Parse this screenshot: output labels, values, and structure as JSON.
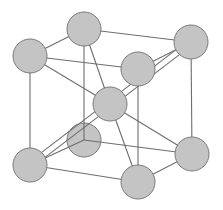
{
  "diagram": {
    "type": "crystal-lattice",
    "structure": "body-centered-cubic",
    "colors": {
      "background": "#ffffff",
      "atom_fill": "#c4c4c4",
      "atom_stroke": "#7a7a7a",
      "bond": "#6e6e6e"
    },
    "atom_radius": 17,
    "atoms": [
      {
        "id": "back-top-left",
        "x": 84,
        "y": 29,
        "layer": "back"
      },
      {
        "id": "back-top-right",
        "x": 191,
        "y": 42,
        "layer": "back"
      },
      {
        "id": "back-bottom-left",
        "x": 84,
        "y": 140,
        "layer": "back"
      },
      {
        "id": "back-bottom-right",
        "x": 192,
        "y": 154,
        "layer": "back"
      },
      {
        "id": "center",
        "x": 110,
        "y": 104,
        "layer": "middle"
      },
      {
        "id": "front-top-left",
        "x": 30,
        "y": 56,
        "layer": "front"
      },
      {
        "id": "front-top-right",
        "x": 138,
        "y": 69,
        "layer": "front"
      },
      {
        "id": "front-bottom-left",
        "x": 30,
        "y": 165,
        "layer": "front"
      },
      {
        "id": "front-bottom-right",
        "x": 138,
        "y": 182,
        "layer": "front"
      }
    ],
    "bonds": [
      {
        "from": "back-top-left",
        "to": "back-top-right"
      },
      {
        "from": "back-top-left",
        "to": "front-top-left"
      },
      {
        "from": "back-top-left",
        "to": "back-bottom-left"
      },
      {
        "from": "back-top-right",
        "to": "front-top-right"
      },
      {
        "from": "back-top-right",
        "to": "back-bottom-right"
      },
      {
        "from": "front-top-left",
        "to": "front-top-right"
      },
      {
        "from": "front-top-left",
        "to": "front-bottom-left"
      },
      {
        "from": "front-top-right",
        "to": "front-bottom-right"
      },
      {
        "from": "back-bottom-left",
        "to": "back-bottom-right"
      },
      {
        "from": "back-bottom-left",
        "to": "front-bottom-left"
      },
      {
        "from": "back-bottom-right",
        "to": "front-bottom-right"
      },
      {
        "from": "front-bottom-left",
        "to": "front-bottom-right"
      },
      {
        "from": "back-top-left",
        "to": "center"
      },
      {
        "from": "front-top-left",
        "to": "center"
      },
      {
        "from": "center",
        "to": "back-bottom-right"
      },
      {
        "from": "center",
        "to": "front-bottom-right"
      }
    ],
    "double_bonds": [
      {
        "from": "center",
        "to": "back-top-right",
        "offset": 3
      },
      {
        "from": "center",
        "to": "front-bottom-left",
        "offset": 3
      }
    ]
  }
}
